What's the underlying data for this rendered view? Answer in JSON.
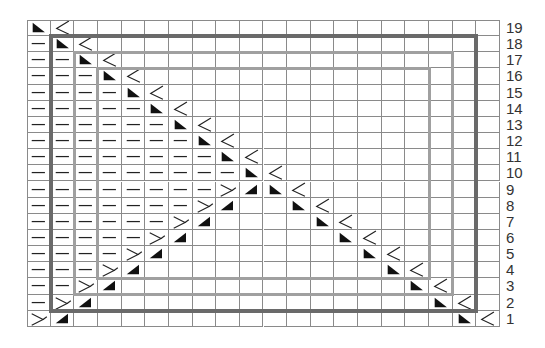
{
  "chart": {
    "type": "knitting-chart",
    "columns": 20,
    "rows": 19,
    "row_labels": [
      "19",
      "18",
      "17",
      "16",
      "15",
      "14",
      "13",
      "12",
      "11",
      "10",
      "9",
      "8",
      "7",
      "6",
      "5",
      "4",
      "3",
      "2",
      "1"
    ],
    "legend_symbols": {
      "dash": "purl (horizontal dash)",
      "tri_left": "dark right-triangle, right angle bottom-left",
      "tri_right": "dark right-triangle, right angle bottom-right",
      "chev_right": "sideways Y opening right",
      "chev_left": "sideways Y opening left"
    },
    "colors": {
      "grid_line": "#8a8a8a",
      "symbol": "#111111",
      "outer_rect": "#6a6a6a",
      "inner_rect": "#a0a0a0",
      "label": "#333333"
    },
    "outlines": [
      {
        "name": "outer",
        "col_start": 2,
        "col_end": 19,
        "row_top": 18,
        "row_bottom": 2,
        "color": "#6a6a6a",
        "width": 4
      },
      {
        "name": "middle",
        "col_start": 3,
        "col_end": 18,
        "row_top": 17,
        "row_bottom": 3,
        "color": "#a0a0a0",
        "width": 3
      },
      {
        "name": "inner",
        "col_start": 4,
        "col_end": 17,
        "row_top": 16,
        "row_bottom": 4,
        "color": "#a0a0a0",
        "width": 3
      }
    ],
    "grid": {
      "19": "tri_left,chev_right,,,,,,,,,,,,,,,,,,",
      "18": "dash,tri_left,chev_right,,,,,,,,,,,,,,,,,",
      "17": "dash,dash,tri_left,chev_right,,,,,,,,,,,,,,,,",
      "16": "dash,dash,dash,tri_left,chev_right,,,,,,,,,,,,,,,",
      "15": "dash,dash,dash,dash,tri_left,chev_right,,,,,,,,,,,,,,",
      "14": "dash,dash,dash,dash,dash,tri_left,chev_right,,,,,,,,,,,,,",
      "13": "dash,dash,dash,dash,dash,dash,tri_left,chev_right,,,,,,,,,,,,",
      "12": "dash,dash,dash,dash,dash,dash,dash,tri_left,chev_right,,,,,,,,,,,",
      "11": "dash,dash,dash,dash,dash,dash,dash,dash,tri_left,chev_right,,,,,,,,,,",
      "10": "dash,dash,dash,dash,dash,dash,dash,dash,dash,tri_left,chev_right,,,,,,,,,",
      "9": "dash,dash,dash,dash,dash,dash,dash,dash,chev_left,tri_right,tri_left,chev_right,,,,,,,,",
      "8": "dash,dash,dash,dash,dash,dash,dash,chev_left,tri_right,,,tri_left,chev_right,,,,,,,",
      "7": "dash,dash,dash,dash,dash,dash,chev_left,tri_right,,,,,tri_left,chev_right,,,,,,",
      "6": "dash,dash,dash,dash,dash,chev_left,tri_right,,,,,,,tri_left,chev_right,,,,,",
      "5": "dash,dash,dash,dash,chev_left,tri_right,,,,,,,,,tri_left,chev_right,,,,",
      "4": "dash,dash,dash,chev_left,tri_right,,,,,,,,,,,tri_left,chev_right,,,",
      "3": "dash,dash,chev_left,tri_right,,,,,,,,,,,,,tri_left,chev_right,,",
      "2": "dash,chev_left,tri_right,,,,,,,,,,,,,,,tri_left,chev_right,",
      "1": "chev_left,tri_right,,,,,,,,,,,,,,,,,tri_left,chev_right"
    }
  }
}
